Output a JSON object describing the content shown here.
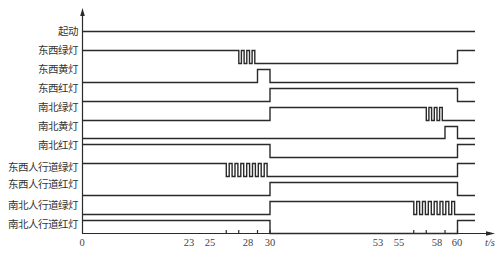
{
  "diagram": {
    "axis": {
      "x_label": "t/s",
      "ticks": [
        0,
        23,
        25,
        28,
        30,
        53,
        55,
        58,
        60
      ],
      "t_end": 62.8
    },
    "signals": [
      {
        "name": "起动",
        "y_high": 31,
        "y_low": 44,
        "segments": [
          [
            0,
            1
          ],
          [
            62.8,
            1
          ]
        ],
        "blink": []
      },
      {
        "name": "东西绿灯",
        "y_high": 50,
        "y_low": 63,
        "segments": [
          [
            0,
            1
          ],
          [
            25,
            "blink"
          ],
          [
            28,
            0
          ],
          [
            60,
            1
          ],
          [
            62.8,
            1
          ]
        ],
        "blink": [
          {
            "start": 25,
            "end": 28,
            "pulses": 3
          }
        ]
      },
      {
        "name": "东西黄灯",
        "y_high": 69,
        "y_low": 82,
        "segments": [
          [
            0,
            0
          ],
          [
            28,
            1
          ],
          [
            30,
            0
          ],
          [
            62.8,
            0
          ]
        ],
        "blink": []
      },
      {
        "name": "东西红灯",
        "y_high": 88,
        "y_low": 101,
        "segments": [
          [
            0,
            0
          ],
          [
            30,
            1
          ],
          [
            60,
            0
          ],
          [
            62.8,
            0
          ]
        ],
        "blink": []
      },
      {
        "name": "南北绿灯",
        "y_high": 107,
        "y_low": 120,
        "segments": [
          [
            0,
            0
          ],
          [
            30,
            1
          ],
          [
            55,
            "blink"
          ],
          [
            58,
            0
          ],
          [
            62.8,
            0
          ]
        ],
        "blink": [
          {
            "start": 55,
            "end": 58,
            "pulses": 3
          }
        ]
      },
      {
        "name": "南北黄灯",
        "y_high": 126,
        "y_low": 138,
        "segments": [
          [
            0,
            0
          ],
          [
            58,
            1
          ],
          [
            60,
            0
          ],
          [
            62.8,
            0
          ]
        ],
        "blink": []
      },
      {
        "name": "南北红灯",
        "y_high": 144,
        "y_low": 157,
        "segments": [
          [
            0,
            1
          ],
          [
            30,
            0
          ],
          [
            60,
            1
          ],
          [
            62.8,
            1
          ]
        ],
        "blink": []
      },
      {
        "name": "东西人行道绿灯",
        "y_high": 163,
        "y_low": 176,
        "segments": [
          [
            0,
            1
          ],
          [
            23,
            "blink"
          ],
          [
            30,
            0
          ],
          [
            60,
            1
          ],
          [
            62.8,
            1
          ]
        ],
        "blink": [
          {
            "start": 23,
            "end": 30,
            "pulses": 7
          }
        ]
      },
      {
        "name": "东西人行道红灯",
        "y_high": 182,
        "y_low": 195,
        "segments": [
          [
            0,
            0
          ],
          [
            30,
            1
          ],
          [
            60,
            0
          ],
          [
            62.8,
            0
          ]
        ],
        "blink": []
      },
      {
        "name": "南北人行道绿灯",
        "y_high": 201,
        "y_low": 214,
        "segments": [
          [
            0,
            0
          ],
          [
            30,
            1
          ],
          [
            53,
            "blink"
          ],
          [
            60,
            0
          ],
          [
            62.8,
            0
          ]
        ],
        "blink": [
          {
            "start": 53,
            "end": 60,
            "pulses": 7
          }
        ]
      },
      {
        "name": "南北人行道红灯",
        "y_high": 220,
        "y_low": 233,
        "segments": [
          [
            0,
            1
          ],
          [
            30,
            0
          ],
          [
            60,
            1
          ],
          [
            62.8,
            1
          ]
        ],
        "blink": []
      }
    ]
  },
  "labels": {
    "s0": "起动",
    "s1": "东西绿灯",
    "s2": "东西黄灯",
    "s3": "东西红灯",
    "s4": "南北绿灯",
    "s5": "南北黄灯",
    "s6": "南北红灯",
    "s7": "东西人行道绿灯",
    "s8": "东西人行道红灯",
    "s9": "南北人行道绿灯",
    "s10": "南北人行道红灯",
    "t0": "0",
    "t23": "23",
    "t25": "25",
    "t28": "28",
    "t30": "30",
    "t53": "53",
    "t55": "55",
    "t58": "58",
    "t60": "60",
    "unit": "t/s"
  }
}
